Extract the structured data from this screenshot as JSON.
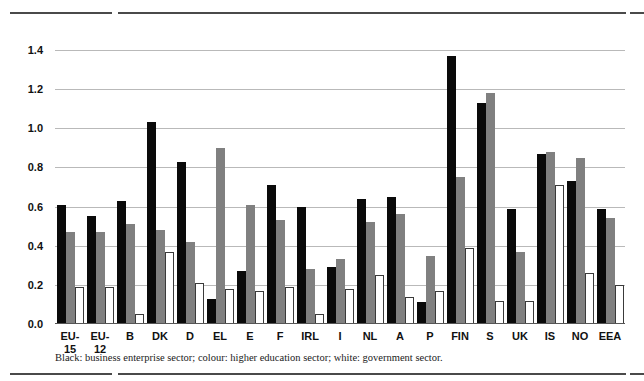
{
  "chart_data": {
    "type": "bar",
    "title": "",
    "subtitle": "",
    "xlabel": "",
    "ylabel": "",
    "ylim": [
      0.0,
      1.4
    ],
    "ytick_values": [
      0.0,
      0.2,
      0.4,
      0.6,
      0.8,
      1.0,
      1.2,
      1.4
    ],
    "ytick_labels": [
      "0.0",
      "0.2",
      "0.4",
      "0.6",
      "0.8",
      "1.0",
      "1.2",
      "1.4"
    ],
    "grid": true,
    "legend_position": "caption-below",
    "categories": [
      "EU-15",
      "EU-12",
      "B",
      "DK",
      "D",
      "EL",
      "E",
      "F",
      "IRL",
      "I",
      "NL",
      "A",
      "P",
      "FIN",
      "S",
      "UK",
      "IS",
      "NO",
      "EEA"
    ],
    "category_lines": [
      [
        "EU-",
        "15"
      ],
      [
        "EU-",
        "12"
      ],
      [
        "B"
      ],
      [
        "DK"
      ],
      [
        "D"
      ],
      [
        "EL"
      ],
      [
        "E"
      ],
      [
        "F"
      ],
      [
        "IRL"
      ],
      [
        "I"
      ],
      [
        "NL"
      ],
      [
        "A"
      ],
      [
        "P"
      ],
      [
        "FIN"
      ],
      [
        "S"
      ],
      [
        "UK"
      ],
      [
        "IS"
      ],
      [
        "NO"
      ],
      [
        "EEA"
      ]
    ],
    "series": [
      {
        "name": "business enterprise sector",
        "color": "#0a0a0a",
        "values": [
          0.61,
          0.55,
          0.63,
          1.03,
          0.83,
          0.13,
          0.27,
          0.71,
          0.6,
          0.29,
          0.64,
          0.65,
          0.11,
          1.37,
          1.13,
          0.59,
          0.87,
          0.73,
          0.59
        ]
      },
      {
        "name": "higher education sector",
        "color": "#808080",
        "values": [
          0.47,
          0.47,
          0.51,
          0.48,
          0.42,
          0.9,
          0.61,
          0.53,
          0.28,
          0.33,
          0.52,
          0.56,
          0.35,
          0.75,
          1.18,
          0.37,
          0.88,
          0.85,
          0.54
        ]
      },
      {
        "name": "government sector",
        "color": "#ffffff",
        "values": [
          0.19,
          0.19,
          0.05,
          0.37,
          0.21,
          0.18,
          0.17,
          0.19,
          0.05,
          0.18,
          0.25,
          0.14,
          0.17,
          0.39,
          0.12,
          0.12,
          0.71,
          0.26,
          0.2
        ]
      }
    ]
  },
  "caption": {
    "text": "Black: business enterprise sector; colour: higher education sector; white: government sector."
  }
}
